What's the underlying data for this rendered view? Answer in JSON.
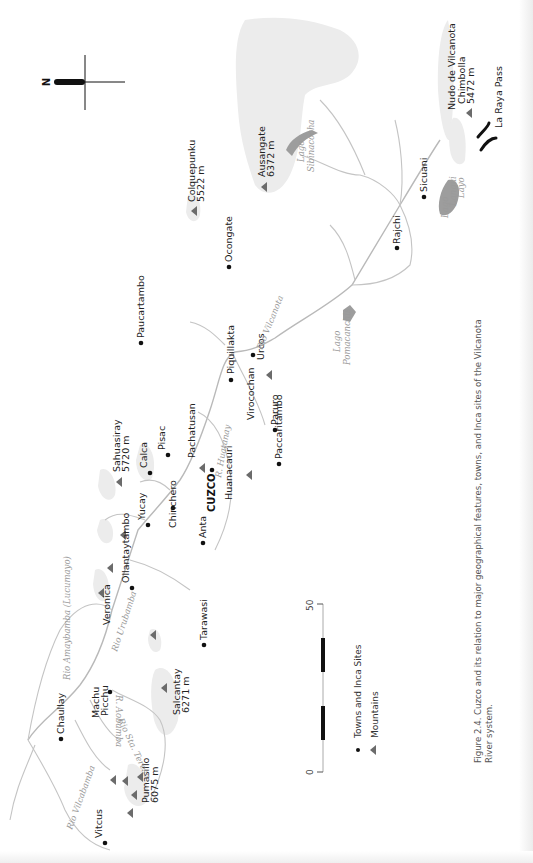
{
  "figure": {
    "caption_line1": "Figure 2.4. Cuzco and its relation to major geographical features, towns, and Inca sites of the Vilcanota",
    "caption_line2": "River system.",
    "orientation": "rotated 90° counter-clockwise (north arrow points left)"
  },
  "north_arrow": {
    "label": "N"
  },
  "legend": {
    "items": [
      {
        "symbol": "dot",
        "label": "Towns and Inca Sites"
      },
      {
        "symbol": "triangle",
        "label": "Mountains"
      }
    ]
  },
  "scale_bar": {
    "start_label": "0",
    "end_label": "50"
  },
  "towns": [
    {
      "name": "Paucartambo"
    },
    {
      "name": "Ocongate"
    },
    {
      "name": "Sicuani"
    },
    {
      "name": "Rajchi"
    },
    {
      "name": "Piquillakta"
    },
    {
      "name": "Urcos"
    },
    {
      "name": "Paruro"
    },
    {
      "name": "Paccaritambo"
    },
    {
      "name": "Pisac"
    },
    {
      "name": "Calca"
    },
    {
      "name": "Chinchero"
    },
    {
      "name": "Yucay"
    },
    {
      "name": "Ollantaytambo"
    },
    {
      "name": "Anta"
    },
    {
      "name": "CUZCO",
      "emphasis": "bold"
    },
    {
      "name": "Tarawasi"
    },
    {
      "name": "Machu Picchu",
      "line1": "Machu",
      "line2": "Picchu"
    },
    {
      "name": "Chaullay"
    },
    {
      "name": "Vitcus"
    }
  ],
  "mountains": [
    {
      "name": "Colquepunku",
      "elevation": "5522 m"
    },
    {
      "name": "Ausangate",
      "elevation": "6372 m"
    },
    {
      "name": "Chimbolla",
      "elevation": "5472 m"
    },
    {
      "name": "Sahuasiray",
      "elevation": "5720 m"
    },
    {
      "name": "Pachatusan"
    },
    {
      "name": "Huanacauri"
    },
    {
      "name": "Virocochan"
    },
    {
      "name": "Veronica"
    },
    {
      "name": "Salcantay",
      "elevation": "6271 m"
    },
    {
      "name": "Pumasillo",
      "elevation": "6075 m"
    }
  ],
  "features": {
    "nudo": "Nudo de Vilcanota",
    "pass": "La Raya Pass"
  },
  "water": {
    "rio_vilcanota": "Rio Vilcanota",
    "r_huatanay": "R. Huatanay",
    "rio_urubamba": "Rio Urubamba",
    "rio_amaybamba": "Rio Amaybamba (Lucumayo)",
    "r_aobamba": "R. Aobamba",
    "rio_sta_teresa": "Rio Sta. Teresa",
    "rio_vilcabamba": "Rio Vilcabamba",
    "lago_sibinacocha_1": "Lago",
    "lago_sibinacocha_2": "Sibinacocha",
    "lago_pomacanchis_1": "Lago",
    "lago_pomacanchis_2": "Pomacanchis",
    "lago_langui_1": "Lago",
    "lago_langui_2": "Langui",
    "lago_langui_3": "Layo"
  }
}
